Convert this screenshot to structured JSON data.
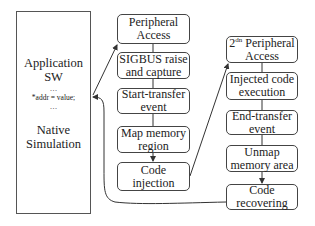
{
  "diagram": {
    "left_box": {
      "title_line1": "Application",
      "title_line2": "SW",
      "code_ellipsis_top": "…",
      "code_line": "*addr = value;",
      "code_ellipsis_bottom": "…",
      "footer_line1": "Native",
      "footer_line2": "Simulation"
    },
    "column1": [
      {
        "id": "peripheral-access",
        "label": "Peripheral\nAccess"
      },
      {
        "id": "sigbus",
        "label": "SIGBUS raise\nand capture"
      },
      {
        "id": "start-transfer",
        "label": "Start-transfer\nevent"
      },
      {
        "id": "map-memory",
        "label": "Map memory\nregion"
      },
      {
        "id": "code-injection",
        "label": "Code\ninjection"
      }
    ],
    "column2": [
      {
        "id": "second-peripheral-access",
        "label_prefix": "2",
        "label_sup": "dn",
        "label_rest": " Peripheral",
        "label_line2": "Access"
      },
      {
        "id": "injected-code-execution",
        "label": "Injected code\nexecution"
      },
      {
        "id": "end-transfer",
        "label": "End-transfer\nevent"
      },
      {
        "id": "unmap-memory",
        "label": "Unmap\nmemory area"
      },
      {
        "id": "code-recovering",
        "label": "Code\nrecovering"
      }
    ],
    "colors": {
      "line": "#333333",
      "box_border": "#444444",
      "background": "#ffffff"
    }
  }
}
